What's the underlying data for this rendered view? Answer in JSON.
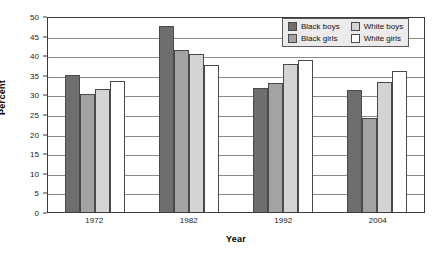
{
  "chart_data": {
    "type": "bar",
    "title": "",
    "subtitle": "",
    "xlabel": "Year",
    "ylabel": "Percent",
    "categories": [
      "1972",
      "1982",
      "1992",
      "2004"
    ],
    "series": [
      {
        "name": "Black boys",
        "color": "#6e6e6e",
        "values": [
          35.0,
          47.5,
          31.7,
          31.0
        ]
      },
      {
        "name": "Black girls",
        "color": "#a3a3a3",
        "values": [
          30.2,
          41.4,
          32.8,
          24.0
        ]
      },
      {
        "name": "White boys",
        "color": "#d4d4d4",
        "values": [
          31.3,
          40.4,
          37.7,
          33.1
        ]
      },
      {
        "name": "White girls",
        "color": "#ffffff",
        "values": [
          33.3,
          37.5,
          38.8,
          36.0
        ]
      }
    ],
    "ylim": [
      0,
      50
    ],
    "ytick_step": 5,
    "yticks": [
      "50",
      "45",
      "40",
      "35",
      "30",
      "25",
      "20",
      "15",
      "10",
      "5",
      "0"
    ],
    "grid": true,
    "grid_axis": "y",
    "legend_position": "top-right",
    "legend_entries": [
      "Black boys",
      "White boys",
      "Black girls",
      "White girls"
    ]
  }
}
